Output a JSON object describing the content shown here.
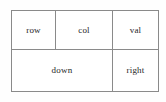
{
  "diagram": {
    "type": "table",
    "title": "",
    "border_color": "#8a8a8a",
    "text_color": "#262626",
    "background": "#ffffff",
    "rows": [
      {
        "name": "top-row",
        "cells": [
          {
            "label": "row"
          },
          {
            "label": "col"
          },
          {
            "label": "val"
          }
        ]
      },
      {
        "name": "bottom-row",
        "cells": [
          {
            "label": "down"
          },
          {
            "label": "right"
          }
        ]
      }
    ]
  }
}
